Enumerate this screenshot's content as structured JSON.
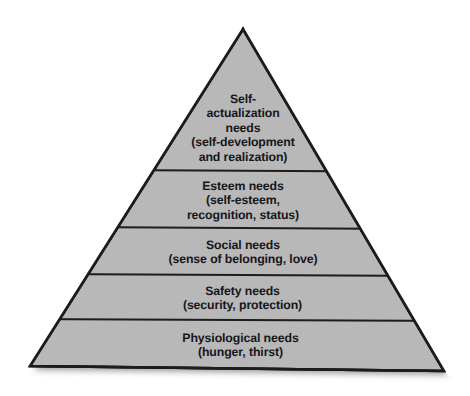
{
  "diagram": {
    "type": "pyramid",
    "name": "maslow-hierarchy-of-needs",
    "orientation": "apex-top",
    "tier_count": 5,
    "colors": {
      "background": "#ffffff",
      "tier_fill": "#b8b8b8",
      "outline": "#1c1c1c",
      "divider": "#1c1c1c",
      "text": "#16161a",
      "shadow": "#9a9a9a"
    },
    "tiers": [
      {
        "id": "self-actualization",
        "rank": 5,
        "heading": "Self-\nactualization\nneeds",
        "detail": "(self-development\nand realization)",
        "text": "Self-\nactualization\nneeds\n(self-development\nand realization)"
      },
      {
        "id": "esteem",
        "rank": 4,
        "heading": "Esteem needs",
        "detail": "(self-esteem,\nrecognition, status)",
        "text": "Esteem needs\n(self-esteem,\nrecognition, status)"
      },
      {
        "id": "social",
        "rank": 3,
        "heading": "Social needs",
        "detail": "(sense of belonging, love)",
        "text": "Social needs\n(sense of belonging, love)"
      },
      {
        "id": "safety",
        "rank": 2,
        "heading": "Safety needs",
        "detail": "(security, protection)",
        "text": "Safety needs\n(security, protection)"
      },
      {
        "id": "physiological",
        "rank": 1,
        "heading": "Physiological needs",
        "detail": "(hunger, thirst)",
        "text": "Physiological needs\n(hunger, thirst)"
      }
    ],
    "geometry": {
      "apex": [
        243,
        29
      ],
      "base_left": [
        30,
        366
      ],
      "base_right": [
        444,
        371
      ],
      "divider_y": [
        170,
        227,
        274,
        319
      ]
    }
  }
}
